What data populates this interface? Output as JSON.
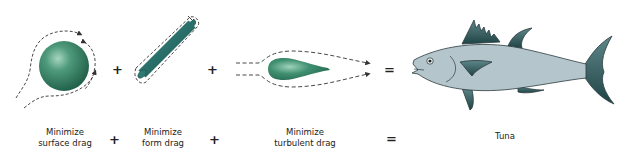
{
  "diagram": {
    "terms": [
      {
        "id": "surface",
        "label_line1": "Minimize",
        "label_line2": "surface drag",
        "shape": "sphere"
      },
      {
        "id": "form",
        "label_line1": "Minimize",
        "label_line2": "form drag",
        "shape": "cylinder"
      },
      {
        "id": "turbulent",
        "label_line1": "Minimize",
        "label_line2": "turbulent drag",
        "shape": "teardrop"
      }
    ],
    "result": {
      "label": "Tuna",
      "shape": "tuna-fish"
    },
    "operators": {
      "plus": "+",
      "equals": "="
    },
    "colors": {
      "shape_green": "#2f7a5e",
      "shape_green_dark": "#1e5a44",
      "shape_highlight": "#9ccfb8",
      "fish_body": "#b4c6cb",
      "fish_fin": "#2f5a5c",
      "outline": "#2b3a3d",
      "flow_line": "#333333"
    }
  }
}
